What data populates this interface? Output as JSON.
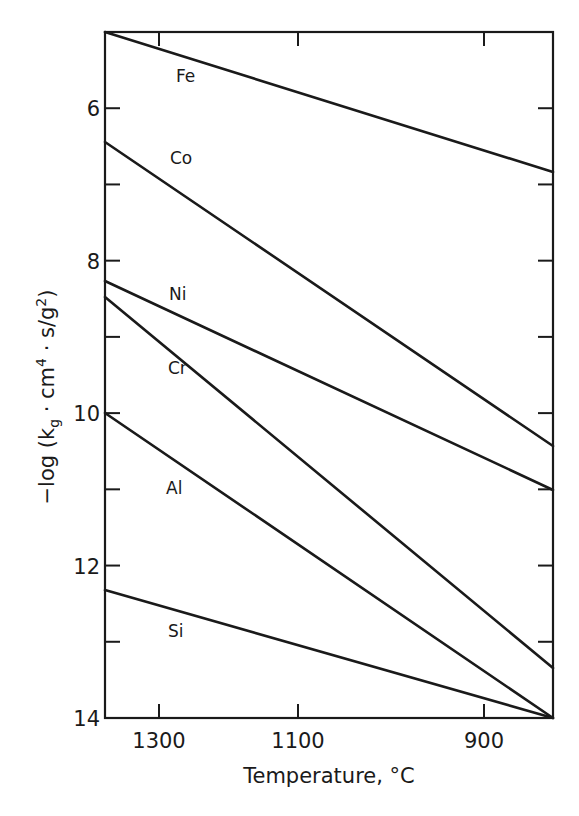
{
  "chart_data": {
    "type": "line",
    "title": "",
    "xlabel": "Temperature, °C",
    "ylabel": "-log (k_g · cm^4 · s/g^2)",
    "ylabel_parts": {
      "prefix": "−log (k",
      "sub": "g",
      "middle": " · cm",
      "sup1": "4",
      "middle2": " · s/g",
      "sup2": "2",
      "suffix": ")"
    },
    "x_axis_note": "reciprocal temperature scale (decreasing left to right)",
    "xlim": [
      1380,
      850
    ],
    "ylim": [
      5,
      14
    ],
    "y_inverted": true,
    "grid": false,
    "legend": "inline labels",
    "x_ticks": [
      {
        "label": "1300",
        "value": 1300
      },
      {
        "label": "1100",
        "value": 1100
      },
      {
        "label": "900",
        "value": 900
      }
    ],
    "y_ticks_major": [
      {
        "label": "6",
        "value": 6
      },
      {
        "label": "8",
        "value": 8
      },
      {
        "label": "10",
        "value": 10
      },
      {
        "label": "12",
        "value": 12
      },
      {
        "label": "14",
        "value": 14
      }
    ],
    "y_ticks_minor": [
      7,
      9,
      11,
      13
    ],
    "x": [
      1380,
      850
    ],
    "series": [
      {
        "name": "Fe",
        "values": [
          5.0,
          6.85
        ]
      },
      {
        "name": "Co",
        "values": [
          6.45,
          8.95
        ]
      },
      {
        "name": "Ni",
        "values": [
          8.25,
          11.0
        ]
      },
      {
        "name": "Cr",
        "values": [
          8.5,
          12.65
        ]
      },
      {
        "name": "Al",
        "values": [
          10.0,
          14.0
        ]
      },
      {
        "name": "Si",
        "values": [
          12.3,
          14.0
        ]
      }
    ]
  },
  "plot_geometry": {
    "left": 105,
    "right": 553,
    "top": 32,
    "bottom": 718,
    "x_tick_px": [
      159,
      298,
      484
    ],
    "series_px": [
      {
        "name": "Fe",
        "x1": 105,
        "y1": 32,
        "x2": 553,
        "y2": 172,
        "label_x": 176,
        "label_y": 82
      },
      {
        "name": "Co",
        "x1": 105,
        "y1": 142,
        "x2": 553,
        "y2": 446,
        "label_x": 170,
        "label_y": 164
      },
      {
        "name": "Ni",
        "x1": 105,
        "y1": 281,
        "x2": 553,
        "y2": 490,
        "label_x": 169,
        "label_y": 300
      },
      {
        "name": "Cr",
        "x1": 105,
        "y1": 297,
        "x2": 553,
        "y2": 668,
        "label_x": 168,
        "label_y": 374
      },
      {
        "name": "Al",
        "x1": 105,
        "y1": 413,
        "x2": 553,
        "y2": 718,
        "label_x": 166,
        "label_y": 494
      },
      {
        "name": "Si",
        "x1": 105,
        "y1": 590,
        "x2": 553,
        "y2": 718,
        "label_x": 168,
        "label_y": 637
      }
    ]
  }
}
